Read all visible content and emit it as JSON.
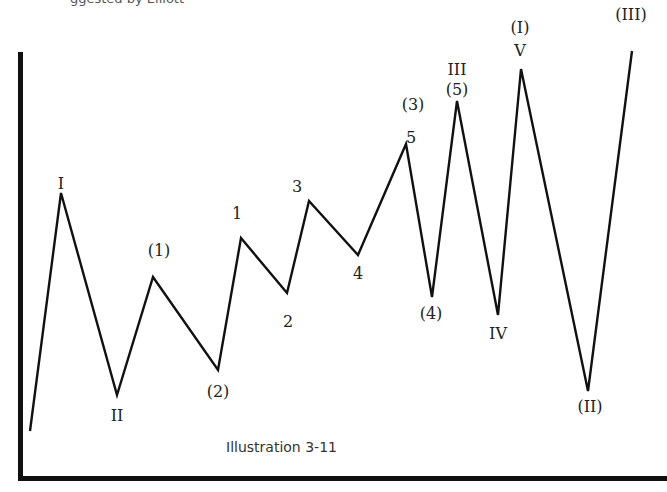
{
  "caption": "Illustration 3-11",
  "top_fragment": "ggested by Elliott",
  "colors": {
    "line": "#111111",
    "axis": "#111111",
    "text": "#222222",
    "background": "#ffffff"
  },
  "chart_data": {
    "type": "line",
    "title": "Illustration 3-11",
    "xlabel": "",
    "ylabel": "",
    "grid": false,
    "axes": {
      "left": true,
      "bottom": true
    },
    "points_px": [
      [
        30,
        431
      ],
      [
        61,
        193
      ],
      [
        117,
        395
      ],
      [
        153,
        277
      ],
      [
        218,
        370
      ],
      [
        241,
        238
      ],
      [
        287,
        293
      ],
      [
        309,
        201
      ],
      [
        358,
        255
      ],
      [
        406,
        144
      ],
      [
        432,
        297
      ],
      [
        457,
        101
      ],
      [
        498,
        315
      ],
      [
        521,
        69
      ],
      [
        588,
        391
      ],
      [
        632,
        51
      ]
    ],
    "labels": [
      {
        "text": "I",
        "x": 61,
        "y": 176
      },
      {
        "text": "II",
        "x": 117,
        "y": 408
      },
      {
        "text": "(1)",
        "x": 159,
        "y": 243
      },
      {
        "text": "(2)",
        "x": 218,
        "y": 384
      },
      {
        "text": "1",
        "x": 237,
        "y": 206
      },
      {
        "text": "2",
        "x": 288,
        "y": 314
      },
      {
        "text": "3",
        "x": 297,
        "y": 179
      },
      {
        "text": "4",
        "x": 358,
        "y": 266
      },
      {
        "text": "5",
        "x": 411,
        "y": 130
      },
      {
        "text": "(3)",
        "x": 413,
        "y": 97
      },
      {
        "text": "(4)",
        "x": 431,
        "y": 306
      },
      {
        "text": "III",
        "x": 457,
        "y": 62
      },
      {
        "text": "(5)",
        "x": 457,
        "y": 82
      },
      {
        "text": "IV",
        "x": 498,
        "y": 326
      },
      {
        "text": "(I)",
        "x": 520,
        "y": 20
      },
      {
        "text": "V",
        "x": 520,
        "y": 43
      },
      {
        "text": "(II)",
        "x": 590,
        "y": 399
      },
      {
        "text": "(III)",
        "x": 631,
        "y": 7
      }
    ]
  }
}
